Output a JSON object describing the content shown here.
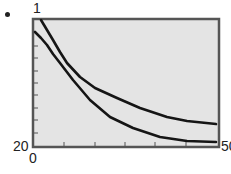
{
  "chart_data": {
    "type": "line",
    "title": "",
    "xlabel": "",
    "ylabel": "",
    "window": {
      "xmin": 0,
      "xmax": 50,
      "ymin": 20,
      "ymax": 1
    },
    "labels": {
      "y_top": "1",
      "y_bottom": "20",
      "x_left": "0",
      "x_right": "50"
    },
    "grid": false,
    "legend": null,
    "background": "#e4e4e4",
    "frame_color": "#555555",
    "curve_color": "#151515",
    "y_ticks_count": 8,
    "x_ticks_count": 5,
    "series": [
      {
        "name": "upper curve",
        "x": [
          2.1,
          5.4,
          9.1,
          12.6,
          16.7,
          22.6,
          28.8,
          36.1,
          41.5,
          49.3
        ],
        "y_pixels": [
          21,
          40,
          63,
          77,
          88,
          98,
          108,
          117,
          121,
          124
        ]
      },
      {
        "name": "lower curve",
        "x": [
          0.5,
          3.8,
          7.3,
          10.8,
          15.4,
          20.8,
          27.0,
          34.2,
          41.5,
          49.3
        ],
        "y_pixels": [
          32,
          45,
          63,
          80,
          100,
          117,
          128,
          137,
          141,
          142
        ]
      }
    ]
  },
  "plot": {
    "frame": {
      "left": 33,
      "top": 19,
      "right": 219,
      "bottom": 147
    },
    "y_tick_px": [
      46,
      58,
      71,
      83,
      95,
      108,
      120,
      133
    ],
    "x_tick_px": [
      64,
      95,
      125,
      155,
      186
    ],
    "upper_px": [
      [
        41,
        20
      ],
      [
        47,
        30
      ],
      [
        53,
        40
      ],
      [
        60,
        52
      ],
      [
        67,
        63
      ],
      [
        80,
        77
      ],
      [
        95,
        88
      ],
      [
        117,
        98
      ],
      [
        140,
        108
      ],
      [
        167,
        117
      ],
      [
        187,
        121
      ],
      [
        216,
        124
      ]
    ],
    "lower_px": [
      [
        35,
        32
      ],
      [
        41,
        38
      ],
      [
        47,
        45
      ],
      [
        53,
        54
      ],
      [
        60,
        63
      ],
      [
        73,
        80
      ],
      [
        90,
        100
      ],
      [
        110,
        117
      ],
      [
        133,
        128
      ],
      [
        160,
        137
      ],
      [
        187,
        141
      ],
      [
        216,
        142
      ]
    ]
  }
}
